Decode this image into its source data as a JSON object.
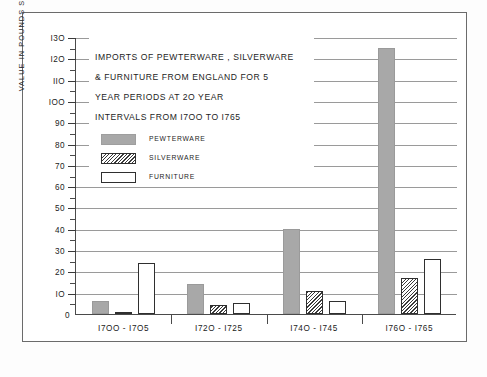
{
  "chart_data": {
    "type": "bar",
    "title_lines": [
      "IMPORTS OF PEWTERWARE , SILVERWARE",
      "& FURNITURE  FROM  ENGLAND  FOR 5",
      "YEAR  PERIODS  AT  2O  YEAR",
      "INTERVALS  FROM  I7OO  TO  I765"
    ],
    "xlabel": "",
    "ylabel": "VALUE  IN  POUNDS  STERLING  X  IOOO",
    "categories": [
      "I7OO - I7O5",
      "I72O - I725",
      "I74O - I745",
      "I76O - I765"
    ],
    "series": [
      {
        "name": "PEWTERWARE",
        "values": [
          6,
          14,
          40,
          125
        ],
        "color": "#a8a8a8",
        "fill": "solid"
      },
      {
        "name": "SILVERWARE",
        "values": [
          1,
          4,
          11,
          17
        ],
        "color": "#ffffff",
        "fill": "hatched"
      },
      {
        "name": "FURNITURE",
        "values": [
          24,
          5,
          6,
          26
        ],
        "color": "#ffffff",
        "fill": "open"
      }
    ],
    "ylim": [
      0,
      130
    ],
    "ytick_major": [
      0,
      10,
      20,
      30,
      40,
      50,
      60,
      70,
      80,
      90,
      100,
      110,
      120,
      130
    ],
    "ytick_major_labels": [
      "0",
      "IO",
      "20",
      "30",
      "40",
      "50",
      "60",
      "70",
      "80",
      "90",
      "IOO",
      "IIO",
      "I2O",
      "I3O"
    ],
    "ytick_minor": [
      5,
      15,
      25,
      35,
      45,
      55,
      65,
      75,
      85,
      95,
      105,
      115,
      125
    ],
    "grid": true,
    "legend_position": "upper-left-inset"
  },
  "legend": {
    "items": [
      {
        "label": "PEWTERWARE",
        "style": "solid-gray"
      },
      {
        "label": "SILVERWARE",
        "style": "hatched"
      },
      {
        "label": "FURNITURE",
        "style": "open-white"
      }
    ]
  },
  "colors": {
    "pewterware": "#a8a8a8",
    "outline": "#2f2f2f",
    "grid": "#9a9a9a",
    "frame": "#6b6b6b",
    "background": "#ffffff"
  }
}
